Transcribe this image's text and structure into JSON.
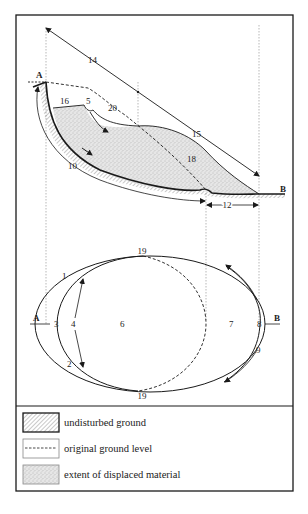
{
  "diagram": {
    "type": "landslide-anatomy",
    "section_labels": {
      "A": "A",
      "B": "B",
      "n14": "14",
      "n15": "15",
      "n16": "16",
      "n5": "5",
      "n20": "20",
      "n18": "18",
      "n10": "10",
      "n12": "12"
    },
    "plan_labels": {
      "n19_top": "19",
      "n19_bottom": "19",
      "n1": "1",
      "n2": "2",
      "n3": "3",
      "n4": "4",
      "n6": "6",
      "n7": "7",
      "n8": "8",
      "n9": "9",
      "A": "A",
      "B": "B"
    }
  },
  "legend": {
    "items": [
      {
        "pattern": "hatched",
        "label": "undisturbed ground"
      },
      {
        "pattern": "dashed-line",
        "label": "original ground level"
      },
      {
        "pattern": "stippled",
        "label": "extent of displaced material"
      }
    ]
  },
  "colors": {
    "line": "#1a1a1a",
    "stipple_bg": "#e4e4e4",
    "hatch": "#777777"
  }
}
